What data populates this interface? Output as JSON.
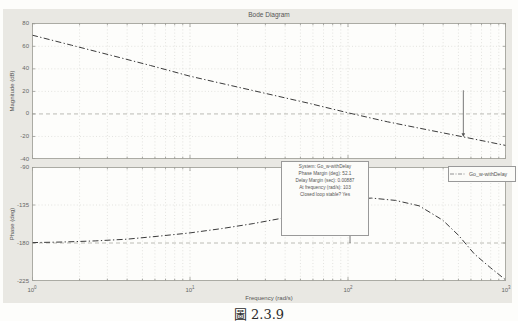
{
  "figure": {
    "title": "Bode Diagram",
    "xlabel": "Frequency (rad/s)",
    "caption": "圖 2.3.9",
    "legend": {
      "label": "Go_w-withDelay"
    },
    "annotation": {
      "lines": [
        "System: Go_w-withDelay",
        "Phase Margin (deg): 52.1",
        "Delay Margin (sec): 0.00887",
        "At frequency (rad/s): 103",
        "Closed loop stable? Yes"
      ]
    },
    "colors": {
      "figure_bg": "#e9e8e3",
      "plot_bg": "#fdfdfb",
      "curve": "#3b3b3b",
      "grid": "#d9d9d4",
      "reference_line": "#ababa5",
      "text": "#555555"
    }
  },
  "chart_data": [
    {
      "type": "line",
      "title": "Bode Diagram",
      "ylabel": "Magnitude (dB)",
      "x_scale": "log",
      "x_start_exp": 0,
      "x_decades": 3,
      "xtick_exponents": [
        0,
        1,
        2,
        3
      ],
      "ylim": [
        -40,
        80
      ],
      "yticks": [
        80,
        60,
        40,
        20,
        0,
        -20,
        -40
      ],
      "y_top": 80.7,
      "y_bottom": -40,
      "ref_line": 0,
      "grid": true,
      "legend_position": "none",
      "series": [
        {
          "name": "Go_w-withDelay",
          "style": "dash-dot",
          "x_log10": [
            0,
            0.25,
            0.5,
            0.75,
            1,
            1.25,
            1.5,
            1.75,
            2,
            2.25,
            2.5,
            2.73,
            3
          ],
          "y": [
            70,
            61,
            52,
            43,
            33.5,
            25.5,
            17.5,
            9.5,
            1,
            -7,
            -14,
            -20.4,
            -28
          ]
        }
      ],
      "gm_marker": {
        "freq": 537,
        "from_db": 21,
        "to_db": -20.4
      },
      "px": {
        "x": 32,
        "y": 23,
        "w": 474,
        "h": 136
      },
      "show_xtick_labels": false
    },
    {
      "type": "line",
      "ylabel": "Phase (deg)",
      "xlabel": "Frequency (rad/s)",
      "x_scale": "log",
      "x_start_exp": 0,
      "x_decades": 3,
      "xtick_exponents": [
        0,
        1,
        2,
        3
      ],
      "ylim": [
        -225,
        -90
      ],
      "yticks": [
        -90,
        -135,
        -180,
        -225
      ],
      "y_top": -90,
      "y_bottom": -225,
      "ref_line": -180,
      "grid": true,
      "legend_position": "top-right",
      "series": [
        {
          "name": "Go_w-withDelay",
          "style": "dash-dot",
          "x_log10": [
            0,
            0.2,
            0.4,
            0.6,
            0.8,
            1,
            1.2,
            1.4,
            1.6,
            1.8,
            1.95,
            2.05,
            2.15,
            2.3,
            2.45,
            2.6,
            2.7,
            2.8,
            2.9,
            3
          ],
          "y": [
            -179.5,
            -178.8,
            -177.5,
            -175.5,
            -172,
            -168,
            -163,
            -157,
            -150,
            -141,
            -130.5,
            -127.5,
            -126.8,
            -129.5,
            -136,
            -153,
            -171,
            -193,
            -209,
            -224
          ]
        }
      ],
      "pm_marker": {
        "freq": 103,
        "phase": -127.9,
        "ref": -180
      },
      "px": {
        "x": 32,
        "y": 167,
        "w": 474,
        "h": 114
      },
      "show_xtick_labels": true
    }
  ]
}
